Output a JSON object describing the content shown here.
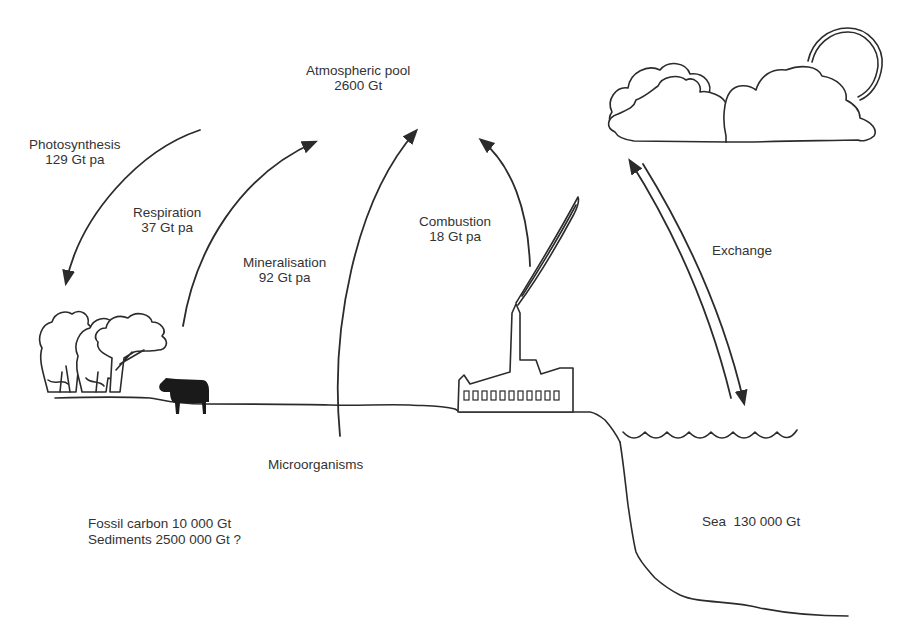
{
  "diagram": {
    "type": "carbon-cycle",
    "pools": {
      "atmosphere": {
        "name": "Atmospheric pool",
        "value": "2600 Gt"
      },
      "fossil": "Fossil carbon 10 000 Gt",
      "sediments": "Sediments 2500 000 Gt ?",
      "sea": "Sea  130 000 Gt"
    },
    "fluxes": {
      "photosynthesis": {
        "name": "Photosynthesis",
        "value": "129 Gt pa",
        "direction": "atmosphere-to-land"
      },
      "respiration": {
        "name": "Respiration",
        "value": "37 Gt pa",
        "direction": "land-to-atmosphere"
      },
      "mineralisation": {
        "name": "Mineralisation",
        "value": "92 Gt pa",
        "direction": "soil-to-atmosphere"
      },
      "combustion": {
        "name": "Combustion",
        "value": "18 Gt pa",
        "direction": "factory-to-atmosphere"
      },
      "exchange": {
        "name": "Exchange",
        "direction": "bidirectional atmosphere-sea"
      }
    },
    "agents": {
      "microorganisms": "Microorganisms"
    },
    "illustrations": [
      "trees-icon",
      "cow-icon",
      "factory-icon",
      "smoke-plume-icon",
      "clouds-icon",
      "sun-icon",
      "sea-waves-icon",
      "coastline"
    ],
    "colors": {
      "ink": "#2b2b2b",
      "background": "#ffffff"
    }
  }
}
